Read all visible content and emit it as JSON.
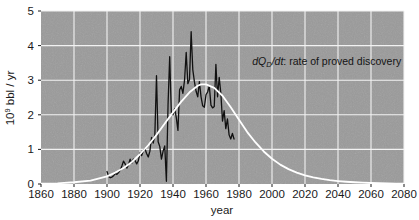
{
  "chart_data": {
    "type": "line",
    "title": "",
    "xlabel": "year",
    "ylabel": "10⁹ bbl / yr",
    "ylabel_parts": {
      "base": "10",
      "exponent": "9",
      "rest": " bbl / yr"
    },
    "xlim": [
      1860,
      2080
    ],
    "ylim": [
      0,
      5
    ],
    "xticks": [
      1860,
      1880,
      1900,
      1920,
      1940,
      1960,
      1980,
      2000,
      2020,
      2040,
      2060,
      2080
    ],
    "yticks": [
      0,
      1,
      2,
      3,
      4,
      5
    ],
    "grid": true,
    "grid_color": "#f2f2f2",
    "plot_bgcolor": "#9a9a9a",
    "figure_bgcolor": "#ffffff",
    "legend": "none",
    "annotations": [
      {
        "name": "discovery-rate-annotation",
        "text": "dQ_D/dt: rate of proved discovery",
        "text_parts": {
          "d1": "d",
          "Q": "Q",
          "D": "D",
          "slash_d": "/d",
          "t": "t",
          "rest": ": rate of proved discovery"
        },
        "x": 1988,
        "y": 3.45
      }
    ],
    "series": [
      {
        "name": "rate of proved discovery (observed)",
        "color": "#111111",
        "width": 1.3,
        "x": [
          1900,
          1901,
          1902,
          1903,
          1904,
          1905,
          1906,
          1907,
          1908,
          1909,
          1910,
          1911,
          1912,
          1913,
          1914,
          1915,
          1916,
          1917,
          1918,
          1919,
          1920,
          1921,
          1922,
          1923,
          1924,
          1925,
          1926,
          1927,
          1928,
          1929,
          1930,
          1931,
          1932,
          1933,
          1934,
          1935,
          1936,
          1937,
          1938,
          1939,
          1940,
          1941,
          1942,
          1943,
          1944,
          1945,
          1946,
          1947,
          1948,
          1949,
          1950,
          1951,
          1952,
          1953,
          1954,
          1955,
          1956,
          1957,
          1958,
          1959,
          1960,
          1961,
          1962,
          1963,
          1964,
          1965,
          1966,
          1967,
          1968,
          1969,
          1970,
          1971,
          1972,
          1973,
          1974,
          1975,
          1976,
          1977
        ],
        "values": [
          0.36,
          0.22,
          0.18,
          0.2,
          0.24,
          0.3,
          0.28,
          0.33,
          0.4,
          0.52,
          0.66,
          0.58,
          0.46,
          0.55,
          0.72,
          0.6,
          0.72,
          0.68,
          0.58,
          0.67,
          0.9,
          0.82,
          0.96,
          1.02,
          0.88,
          0.78,
          0.95,
          1.35,
          1.18,
          1.42,
          3.13,
          1.22,
          1.08,
          0.72,
          0.95,
          1.1,
          0.08,
          2.3,
          3.68,
          2.05,
          2.0,
          2.18,
          1.92,
          1.55,
          2.72,
          2.82,
          2.62,
          3.0,
          3.8,
          2.9,
          3.02,
          4.4,
          3.3,
          2.95,
          2.68,
          2.52,
          2.96,
          2.52,
          2.26,
          2.22,
          2.58,
          2.66,
          2.84,
          2.28,
          2.2,
          2.24,
          3.46,
          2.52,
          3.08,
          2.62,
          1.82,
          2.12,
          1.6,
          1.88,
          1.42,
          1.3,
          1.46,
          1.3
        ]
      },
      {
        "name": "Hubbert fitted discovery curve",
        "color": "#ffffff",
        "width": 1.8,
        "x": [
          1860,
          1870,
          1880,
          1890,
          1900,
          1905,
          1910,
          1915,
          1920,
          1925,
          1930,
          1935,
          1940,
          1945,
          1950,
          1955,
          1957,
          1960,
          1965,
          1970,
          1975,
          1980,
          1985,
          1990,
          1995,
          2000,
          2005,
          2010,
          2015,
          2020,
          2025,
          2030,
          2035,
          2040,
          2045,
          2050,
          2055,
          2060,
          2065,
          2070,
          2075,
          2080
        ],
        "values": [
          0.01,
          0.02,
          0.05,
          0.1,
          0.22,
          0.33,
          0.46,
          0.63,
          0.86,
          1.12,
          1.42,
          1.75,
          2.07,
          2.38,
          2.65,
          2.84,
          2.88,
          2.88,
          2.78,
          2.55,
          2.22,
          1.86,
          1.5,
          1.2,
          0.94,
          0.73,
          0.56,
          0.43,
          0.33,
          0.25,
          0.19,
          0.145,
          0.11,
          0.085,
          0.065,
          0.05,
          0.038,
          0.029,
          0.022,
          0.017,
          0.013,
          0.01
        ]
      }
    ]
  }
}
